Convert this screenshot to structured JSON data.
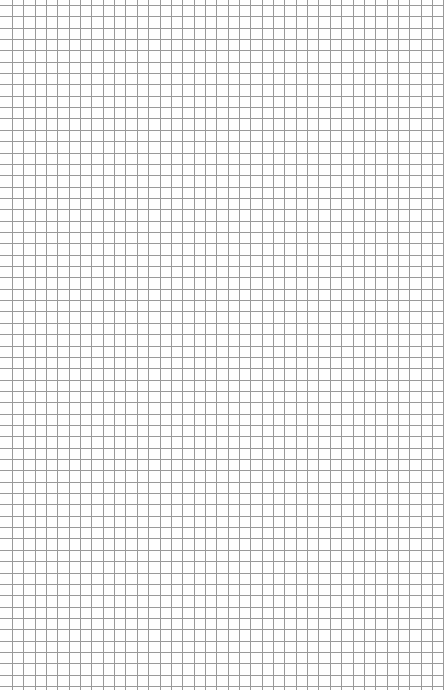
{
  "page": {
    "type": "graph-paper",
    "background_color": "#ffffff",
    "grid": {
      "line_color": "#9a9a9a",
      "line_width": 1,
      "spacing_px": 11.35,
      "offset_x": 12,
      "offset_y": 5,
      "columns": 39,
      "rows": 61
    }
  }
}
